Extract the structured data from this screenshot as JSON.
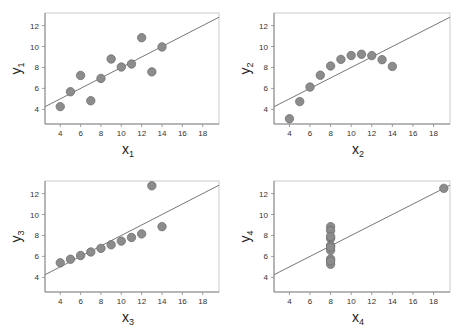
{
  "chart_data": [
    {
      "type": "scatter",
      "title": "",
      "xlabel": "x1",
      "ylabel": "y1",
      "xlabel_main": "x",
      "xlabel_sub": "1",
      "ylabel_main": "y",
      "ylabel_sub": "1",
      "xlim": [
        2.5,
        19.6
      ],
      "ylim": [
        2.6,
        13.2
      ],
      "xticks": [
        4,
        6,
        8,
        10,
        12,
        14,
        16,
        18
      ],
      "yticks": [
        4,
        6,
        8,
        10,
        12
      ],
      "grid": false,
      "x": [
        10,
        8,
        13,
        9,
        11,
        14,
        6,
        4,
        12,
        7,
        5
      ],
      "y": [
        8.04,
        6.95,
        7.58,
        8.81,
        8.33,
        9.96,
        7.24,
        4.26,
        10.84,
        4.82,
        5.68
      ],
      "fit_line": {
        "intercept": 3.0,
        "slope": 0.5
      }
    },
    {
      "type": "scatter",
      "title": "",
      "xlabel": "x2",
      "ylabel": "y2",
      "xlabel_main": "x",
      "xlabel_sub": "2",
      "ylabel_main": "y",
      "ylabel_sub": "2",
      "xlim": [
        2.5,
        19.6
      ],
      "ylim": [
        2.6,
        13.2
      ],
      "xticks": [
        4,
        6,
        8,
        10,
        12,
        14,
        16,
        18
      ],
      "yticks": [
        4,
        6,
        8,
        10,
        12
      ],
      "grid": false,
      "x": [
        10,
        8,
        13,
        9,
        11,
        14,
        6,
        4,
        12,
        7,
        5
      ],
      "y": [
        9.14,
        8.14,
        8.74,
        8.77,
        9.26,
        8.1,
        6.13,
        3.1,
        9.13,
        7.26,
        4.74
      ],
      "fit_line": {
        "intercept": 3.0,
        "slope": 0.5
      }
    },
    {
      "type": "scatter",
      "title": "",
      "xlabel": "x3",
      "ylabel": "y3",
      "xlabel_main": "x",
      "xlabel_sub": "3",
      "ylabel_main": "y",
      "ylabel_sub": "3",
      "xlim": [
        2.5,
        19.6
      ],
      "ylim": [
        2.6,
        13.2
      ],
      "xticks": [
        4,
        6,
        8,
        10,
        12,
        14,
        16,
        18
      ],
      "yticks": [
        4,
        6,
        8,
        10,
        12
      ],
      "grid": false,
      "x": [
        10,
        8,
        13,
        9,
        11,
        14,
        6,
        4,
        12,
        7,
        5
      ],
      "y": [
        7.46,
        6.77,
        12.74,
        7.11,
        7.81,
        8.84,
        6.08,
        5.39,
        8.15,
        6.42,
        5.73
      ],
      "fit_line": {
        "intercept": 3.0,
        "slope": 0.5
      }
    },
    {
      "type": "scatter",
      "title": "",
      "xlabel": "x4",
      "ylabel": "y4",
      "xlabel_main": "x",
      "xlabel_sub": "4",
      "ylabel_main": "y",
      "ylabel_sub": "4",
      "xlim": [
        2.5,
        19.6
      ],
      "ylim": [
        2.6,
        13.2
      ],
      "xticks": [
        4,
        6,
        8,
        10,
        12,
        14,
        16,
        18
      ],
      "yticks": [
        4,
        6,
        8,
        10,
        12
      ],
      "grid": false,
      "x": [
        8,
        8,
        8,
        8,
        8,
        8,
        8,
        19,
        8,
        8,
        8
      ],
      "y": [
        6.58,
        5.76,
        7.71,
        8.84,
        8.47,
        7.04,
        5.25,
        12.5,
        5.56,
        7.91,
        6.89
      ],
      "fit_line": {
        "intercept": 3.0,
        "slope": 0.5
      }
    }
  ],
  "style": {
    "point_fill": "#8c8c8c",
    "point_stroke": "#6e6e6e",
    "line_color": "#777777",
    "axis_color": "#888888"
  },
  "panels_layout": [
    {
      "left": 45,
      "top": 13,
      "right": 219,
      "bottom": 124
    },
    {
      "left": 274,
      "top": 13,
      "right": 450,
      "bottom": 124
    },
    {
      "left": 45,
      "top": 181,
      "right": 219,
      "bottom": 292
    },
    {
      "left": 274,
      "top": 181,
      "right": 450,
      "bottom": 292
    }
  ]
}
